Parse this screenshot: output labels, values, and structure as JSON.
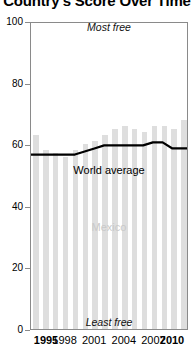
{
  "chart_data": {
    "type": "bar",
    "title": "Country's Score Over Time",
    "xlabel": "",
    "ylabel": "",
    "ylim": [
      0,
      100
    ],
    "yticks": [
      0,
      20,
      40,
      60,
      80,
      100
    ],
    "grid": false,
    "legend": "none",
    "categories": [
      "1995",
      "1996",
      "1997",
      "1998",
      "1999",
      "2000",
      "2001",
      "2002",
      "2003",
      "2004",
      "2005",
      "2006",
      "2007",
      "2008",
      "2009",
      "2010"
    ],
    "xtick_labels": [
      "1995",
      "1998",
      "2001",
      "2004",
      "2007",
      "2010"
    ],
    "xtick_categories": [
      "1995",
      "1998",
      "2001",
      "2004",
      "2007",
      "2010"
    ],
    "series": [
      {
        "name": "Mexico",
        "kind": "bar",
        "color": "#dedede",
        "values": [
          63,
          58,
          57,
          56,
          58,
          60,
          61,
          63,
          65,
          66,
          65,
          64,
          66,
          66,
          65,
          68
        ]
      },
      {
        "name": "World average",
        "kind": "line",
        "color": "#000000",
        "values": [
          57,
          57,
          57,
          57,
          57,
          58,
          59,
          60,
          60,
          60,
          60,
          60,
          61,
          61,
          59,
          59
        ]
      }
    ],
    "annotations": [
      {
        "text": "Most free",
        "position": "top-center",
        "style": "italic"
      },
      {
        "text": "Least free",
        "position": "bottom-center",
        "style": "italic"
      },
      {
        "text": "World average",
        "position": "mid-center",
        "style": "normal"
      },
      {
        "text": "Mexico",
        "position": "inside-bars",
        "style": "normal",
        "color": "#c9c9c9"
      }
    ]
  },
  "labels": {
    "title": "Country's Score Over Time",
    "most_free": "Most free",
    "least_free": "Least free",
    "world_average": "World average",
    "country": "Mexico"
  }
}
